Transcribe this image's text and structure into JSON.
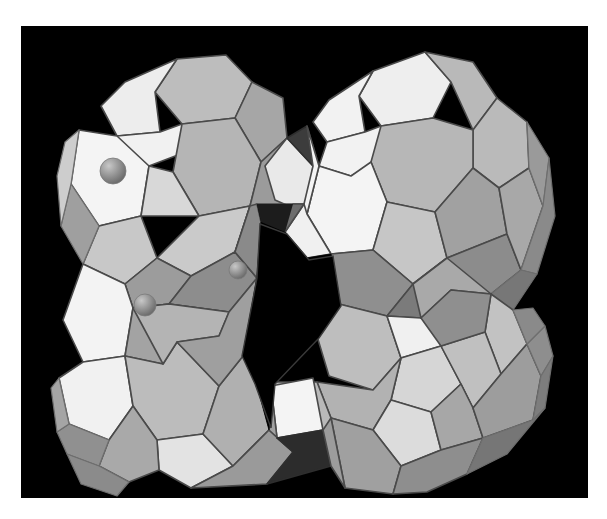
{
  "figure": {
    "title": "Zeolite framework polyhedral model",
    "background_color": "#000000",
    "page_color": "#ffffff",
    "frame": {
      "x": 21,
      "y": 26,
      "width": 567,
      "height": 472
    }
  },
  "palette": {
    "void_black": "#000000",
    "face_highlight": "#f2f2f2",
    "face_light": "#e2e2e2",
    "face_midlight": "#cfcfcf",
    "face_mid": "#bdbdbd",
    "face_middark": "#a8a8a8",
    "face_dark": "#929292",
    "face_darker": "#7d7d7d",
    "face_shadow": "#6a6a6a",
    "face_deep": "#585858",
    "edge_color": "#4a4a4a",
    "sphere_color": "#9a9a9a",
    "sphere_highlight": "#c4c4c4",
    "sphere_shadow": "#6d6d6d"
  },
  "structure": {
    "cages": [
      {
        "id": "cage-top-left",
        "label": "sodalite cage (top left)",
        "center_x": 148,
        "center_y": 135
      },
      {
        "id": "cage-top-right",
        "label": "sodalite cage (top right)",
        "center_x": 393,
        "center_y": 125
      },
      {
        "id": "cage-bottom-left",
        "label": "sodalite cage (bottom left)",
        "center_x": 158,
        "center_y": 350
      },
      {
        "id": "cage-bottom-right",
        "label": "sodalite cage (bottom right)",
        "center_x": 400,
        "center_y": 338
      }
    ],
    "connectors": [
      {
        "id": "prism-top",
        "label": "hexagonal prism (top link)"
      },
      {
        "id": "prism-bottom",
        "label": "hexagonal prism (bottom link)"
      },
      {
        "id": "prism-left",
        "label": "hexagonal prism (left link)"
      },
      {
        "id": "prism-right",
        "label": "hexagonal prism (right link)"
      }
    ],
    "void": {
      "id": "supercage-void",
      "label": "central supercage opening"
    },
    "cations": [
      {
        "id": "cation-1",
        "label": "cation site sphere 1",
        "cx": 92,
        "cy": 145,
        "r": 13
      },
      {
        "id": "cation-2",
        "label": "cation site sphere 2",
        "cx": 217,
        "cy": 244,
        "r": 9
      },
      {
        "id": "cation-3",
        "label": "cation site sphere 3",
        "cx": 124,
        "cy": 279,
        "r": 11
      }
    ]
  }
}
